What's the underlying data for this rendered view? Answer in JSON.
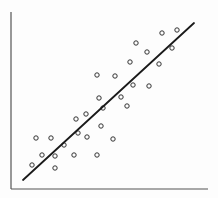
{
  "chart_data": {
    "type": "scatter",
    "title": "",
    "xlabel": "",
    "ylabel": "",
    "grid": false,
    "legend": null,
    "axes": {
      "color": "#555555",
      "origin_px": [
        11,
        189
      ],
      "x_end_px": 208,
      "y_end_px": 12
    },
    "marker": {
      "shape": "open-circle",
      "radius_px": 2.2,
      "stroke": "#333333",
      "fill": "none"
    },
    "trendline": {
      "type": "linear",
      "color": "#1a1a1a",
      "from_px": [
        23,
        180
      ],
      "to_px": [
        194,
        23
      ]
    },
    "points_px": [
      [
        162,
        33
      ],
      [
        177,
        30
      ],
      [
        136,
        43
      ],
      [
        147,
        52
      ],
      [
        172,
        48
      ],
      [
        130,
        62
      ],
      [
        159,
        64
      ],
      [
        97,
        75
      ],
      [
        115,
        76
      ],
      [
        133,
        85
      ],
      [
        149,
        86
      ],
      [
        99,
        98
      ],
      [
        121,
        97
      ],
      [
        103,
        108
      ],
      [
        127,
        106
      ],
      [
        86,
        114
      ],
      [
        76,
        119
      ],
      [
        101,
        126
      ],
      [
        78,
        133
      ],
      [
        87,
        137
      ],
      [
        36,
        138
      ],
      [
        51,
        138
      ],
      [
        113,
        139
      ],
      [
        64,
        145
      ],
      [
        42,
        155
      ],
      [
        55,
        156
      ],
      [
        74,
        155
      ],
      [
        97,
        155
      ],
      [
        32,
        165
      ],
      [
        55,
        168
      ]
    ],
    "points": [
      {
        "x": 7.6,
        "y": 8.7
      },
      {
        "x": 8.4,
        "y": 8.9
      },
      {
        "x": 6.3,
        "y": 8.0
      },
      {
        "x": 6.9,
        "y": 7.5
      },
      {
        "x": 8.2,
        "y": 7.8
      },
      {
        "x": 6.0,
        "y": 7.2
      },
      {
        "x": 7.5,
        "y": 7.0
      },
      {
        "x": 4.4,
        "y": 6.4
      },
      {
        "x": 5.3,
        "y": 6.4
      },
      {
        "x": 6.2,
        "y": 5.9
      },
      {
        "x": 7.0,
        "y": 5.8
      },
      {
        "x": 4.5,
        "y": 5.1
      },
      {
        "x": 5.6,
        "y": 5.2
      },
      {
        "x": 4.7,
        "y": 4.6
      },
      {
        "x": 5.9,
        "y": 4.7
      },
      {
        "x": 3.8,
        "y": 4.2
      },
      {
        "x": 3.3,
        "y": 3.9
      },
      {
        "x": 4.6,
        "y": 3.5
      },
      {
        "x": 3.4,
        "y": 3.1
      },
      {
        "x": 3.9,
        "y": 2.9
      },
      {
        "x": 1.3,
        "y": 2.9
      },
      {
        "x": 2.0,
        "y": 2.9
      },
      {
        "x": 5.2,
        "y": 2.8
      },
      {
        "x": 2.7,
        "y": 2.5
      },
      {
        "x": 1.6,
        "y": 1.9
      },
      {
        "x": 2.2,
        "y": 1.9
      },
      {
        "x": 3.2,
        "y": 1.9
      },
      {
        "x": 4.4,
        "y": 1.9
      },
      {
        "x": 1.1,
        "y": 1.4
      },
      {
        "x": 2.2,
        "y": 1.2
      }
    ],
    "xlim": [
      0,
      10
    ],
    "ylim": [
      0,
      10
    ],
    "x_ticks": [],
    "y_ticks": []
  }
}
